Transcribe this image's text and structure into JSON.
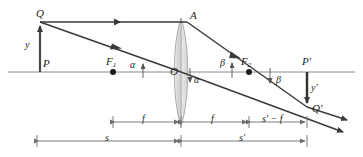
{
  "figure": {
    "type": "optics-ray-diagram",
    "canvas": {
      "width": 363,
      "height": 157
    },
    "colors": {
      "ink": "#231f20",
      "axis": "#808080",
      "ray": "#3a3a3a",
      "lens_fill": "#d9d9d9",
      "lens_stroke": "#9a9a9a",
      "dimension": "#6e6e6e",
      "background": "#ffffff"
    }
  },
  "points": {
    "Q": {
      "label": "Q",
      "x": 40,
      "y": 22,
      "label_x": 36,
      "label_y": 8
    },
    "P": {
      "label": "P",
      "x": 40,
      "y": 72,
      "label_x": 43,
      "label_y": 58
    },
    "F1": {
      "label": "F",
      "sub": "1",
      "x": 113,
      "y": 72,
      "label_x": 106,
      "label_y": 56
    },
    "O": {
      "label": "O",
      "x": 181,
      "y": 72,
      "label_x": 170,
      "label_y": 66
    },
    "A": {
      "label": "A",
      "x": 187,
      "y": 22,
      "label_x": 190,
      "label_y": 10
    },
    "F2": {
      "label": "F",
      "sub": "2",
      "x": 249,
      "y": 72,
      "label_x": 241,
      "label_y": 56
    },
    "Pprime": {
      "label": "P′",
      "x": 307,
      "y": 72,
      "label_x": 303,
      "label_y": 57
    },
    "Qprime": {
      "label": "Q′",
      "x": 307,
      "y": 107,
      "label_x": 312,
      "label_y": 104
    }
  },
  "heights": {
    "object": {
      "label": "y",
      "label_x": 25,
      "label_y": 40
    },
    "image": {
      "label": "y′",
      "label_x": 312,
      "label_y": 84
    }
  },
  "angles": [
    {
      "label": "α",
      "label_x": 131,
      "label_y": 60,
      "arrow": "up",
      "at_x": 143,
      "at_y": 72
    },
    {
      "label": "α",
      "label_x": 195,
      "label_y": 76,
      "arrow": "down",
      "at_x": 190,
      "at_y": 72
    },
    {
      "label": "β",
      "label_x": 221,
      "label_y": 58,
      "arrow": "up",
      "at_x": 232,
      "at_y": 72
    },
    {
      "label": "β",
      "label_x": 277,
      "label_y": 76,
      "arrow": "down",
      "at_x": 270,
      "at_y": 72
    }
  ],
  "dimensions": {
    "focal_row": [
      {
        "label": "f",
        "x1": 113,
        "x2": 181,
        "y": 122
      },
      {
        "label": "f",
        "x1": 181,
        "x2": 249,
        "y": 122
      },
      {
        "label": "s′ − f",
        "x1": 249,
        "x2": 307,
        "y": 122
      }
    ],
    "distance_row": [
      {
        "label": "s",
        "x1": 37,
        "x2": 181,
        "y": 141
      },
      {
        "label": "s′",
        "x1": 181,
        "x2": 307,
        "y": 141
      }
    ]
  },
  "rays": [
    {
      "name": "parallel-ray",
      "description": "From Q parallel to the axis to point A on the lens, then refracted through F2 to Q' and beyond",
      "segments": [
        {
          "x1": 40,
          "y1": 22,
          "x2": 187,
          "y2": 22
        },
        {
          "x1": 187,
          "y1": 22,
          "x2": 307,
          "y2": 107
        },
        {
          "x1": 307,
          "y1": 107,
          "x2": 345,
          "y2": 119
        }
      ],
      "arrow_marks": [
        {
          "x": 118,
          "y": 22,
          "angle": 0
        },
        {
          "x": 237,
          "y": 57,
          "angle": 35
        },
        {
          "x": 341,
          "y": 118,
          "angle": 18
        }
      ]
    },
    {
      "name": "chief-ray",
      "description": "From Q through the lens centre O and on to Q' and beyond",
      "segments": [
        {
          "x1": 40,
          "y1": 22,
          "x2": 181,
          "y2": 72
        },
        {
          "x1": 181,
          "y1": 72,
          "x2": 307,
          "y2": 107
        },
        {
          "x1": 307,
          "y1": 107,
          "x2": 340,
          "y2": 130
        }
      ],
      "arrow_marks": [
        {
          "x": 118,
          "y": 50,
          "angle": 19
        },
        {
          "x": 337,
          "y": 128,
          "angle": 33
        }
      ]
    }
  ],
  "axis": {
    "x1": 8,
    "y": 72,
    "x2": 355
  },
  "lens": {
    "cx": 181,
    "top_y": 18,
    "bottom_y": 126,
    "half_width": 7
  }
}
